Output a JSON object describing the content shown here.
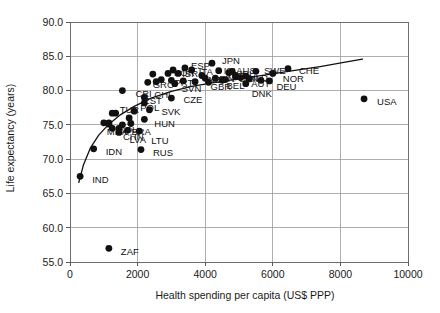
{
  "chart_data": {
    "type": "scatter",
    "title": "",
    "xlabel": "Health spending per capita (US$ PPP)",
    "ylabel": "Life expectancy (years)",
    "xlim": [
      0,
      10000
    ],
    "ylim": [
      55.0,
      90.0
    ],
    "xticks": [
      0,
      2000,
      4000,
      6000,
      8000,
      10000
    ],
    "xtick_labels": [
      "0",
      "2000",
      "4000",
      "6000",
      "8000",
      "10000"
    ],
    "yticks": [
      55.0,
      60.0,
      65.0,
      70.0,
      75.0,
      80.0,
      85.0,
      90.0
    ],
    "ytick_labels": [
      "55.0",
      "60.0",
      "65.0",
      "70.0",
      "75.0",
      "80.0",
      "85.0",
      "90.0"
    ],
    "grid": true,
    "legend": "none",
    "marker_color": "#111111",
    "trend_color": "#111111",
    "points": [
      {
        "label": "IND",
        "x": 300,
        "y": 67.5,
        "lx": 12,
        "ly": 3.5
      },
      {
        "label": "ZAF",
        "x": 1150,
        "y": 57.0,
        "lx": 12,
        "ly": 3.5
      },
      {
        "label": "IDN",
        "x": 700,
        "y": 71.5,
        "lx": 12,
        "ly": 3.5
      },
      {
        "label": "RUS",
        "x": 2100,
        "y": 71.4,
        "lx": 12,
        "ly": 3.5
      },
      {
        "label": "COL",
        "x": 1150,
        "y": 75.3,
        "lx": 9,
        "ly": 7.5
      },
      {
        "label": "CHN",
        "x": 1450,
        "y": 74.5,
        "lx": 4,
        "ly": 9
      },
      {
        "label": "TUR",
        "x": 1350,
        "y": 76.7,
        "lx": 4,
        "ly": -3
      },
      {
        "label": "POL",
        "x": 1900,
        "y": 77.0,
        "lx": 6,
        "ly": -3
      },
      {
        "label": "LVA",
        "x": 1700,
        "y": 74.2,
        "lx": 2,
        "ly": 10
      },
      {
        "label": "LTU",
        "x": 2050,
        "y": 74.1,
        "lx": 12,
        "ly": 9.5
      },
      {
        "label": "BRA",
        "x": 1550,
        "y": 75.0,
        "lx": 9,
        "ly": 7
      },
      {
        "label": "MEX",
        "x": 1150,
        "y": 75.1,
        "lx": -2,
        "ly": 8
      },
      {
        "label": "HUN",
        "x": 2200,
        "y": 75.8,
        "lx": 10,
        "ly": 5
      },
      {
        "label": "SVK",
        "x": 2350,
        "y": 77.2,
        "lx": 12,
        "ly": 2
      },
      {
        "label": "CZE",
        "x": 3000,
        "y": 78.9,
        "lx": 12,
        "ly": 1.5
      },
      {
        "label": "CHL",
        "x": 2200,
        "y": 79.0,
        "lx": 10,
        "ly": -2
      },
      {
        "label": "CRI",
        "x": 1550,
        "y": 80.0,
        "lx": 13,
        "ly": 3
      },
      {
        "label": "EST",
        "x": 2200,
        "y": 78.2,
        "lx": -1,
        "ly": -2
      },
      {
        "label": "GRC",
        "x": 2300,
        "y": 81.2,
        "lx": 5,
        "ly": 3
      },
      {
        "label": "KOR",
        "x": 2900,
        "y": 82.5,
        "lx": 6,
        "ly": 0
      },
      {
        "label": "SVN",
        "x": 3100,
        "y": 81.0,
        "lx": 7,
        "ly": 5
      },
      {
        "label": "PRT",
        "x": 3000,
        "y": 81.5,
        "lx": 3,
        "ly": 3
      },
      {
        "label": "ESP",
        "x": 3400,
        "y": 83.3,
        "lx": 6,
        "ly": -2
      },
      {
        "label": "ITA",
        "x": 3600,
        "y": 83.0,
        "lx": 7,
        "ly": 2
      },
      {
        "label": "JPN",
        "x": 4200,
        "y": 84.0,
        "lx": 10,
        "ly": -2
      },
      {
        "label": "ISR",
        "x": 3200,
        "y": 82.5,
        "lx": 4,
        "ly": 1
      },
      {
        "label": "NZL",
        "x": 4000,
        "y": 81.8,
        "lx": 3,
        "ly": 2
      },
      {
        "label": "FIN",
        "x": 4300,
        "y": 81.8,
        "lx": 4,
        "ly": 1
      },
      {
        "label": "GBR",
        "x": 4100,
        "y": 81.2,
        "lx": 2,
        "ly": 5
      },
      {
        "label": "ISL",
        "x": 4400,
        "y": 82.9,
        "lx": 5,
        "ly": 0
      },
      {
        "label": "AUS",
        "x": 4800,
        "y": 82.8,
        "lx": 4,
        "ly": 0
      },
      {
        "label": "FRA",
        "x": 4700,
        "y": 82.6,
        "lx": 3,
        "ly": 3
      },
      {
        "label": "CAN",
        "x": 4900,
        "y": 82.0,
        "lx": 3,
        "ly": 2
      },
      {
        "label": "BEL",
        "x": 4600,
        "y": 81.6,
        "lx": 1,
        "ly": 6
      },
      {
        "label": "IRL",
        "x": 4900,
        "y": 82.2,
        "lx": 4,
        "ly": -1
      },
      {
        "label": "NLD",
        "x": 5200,
        "y": 82.1,
        "lx": 3,
        "ly": 2
      },
      {
        "label": "AUT",
        "x": 5300,
        "y": 81.7,
        "lx": 2,
        "ly": 5
      },
      {
        "label": "SWE",
        "x": 5500,
        "y": 82.8,
        "lx": 8,
        "ly": 0
      },
      {
        "label": "DEU",
        "x": 5900,
        "y": 81.4,
        "lx": 7,
        "ly": 6
      },
      {
        "label": "DNK",
        "x": 5200,
        "y": 81.0,
        "lx": 6,
        "ly": 10
      },
      {
        "label": "NOR",
        "x": 6000,
        "y": 82.5,
        "lx": 10,
        "ly": 6
      },
      {
        "label": "CHE",
        "x": 6450,
        "y": 83.2,
        "lx": 11,
        "ly": 2
      },
      {
        "label": "USA",
        "x": 8700,
        "y": 78.8,
        "lx": 13,
        "ly": 3.5
      },
      {
        "label": "",
        "x": 1000,
        "y": 75.3,
        "lx": 0,
        "ly": 0
      },
      {
        "label": "",
        "x": 1250,
        "y": 76.7,
        "lx": 0,
        "ly": 0
      },
      {
        "label": "",
        "x": 1750,
        "y": 76.0,
        "lx": 0,
        "ly": 0
      },
      {
        "label": "",
        "x": 1450,
        "y": 73.9,
        "lx": 0,
        "ly": 0
      },
      {
        "label": "",
        "x": 1800,
        "y": 75.2,
        "lx": 0,
        "ly": 0
      },
      {
        "label": "",
        "x": 1250,
        "y": 74.5,
        "lx": 0,
        "ly": 0
      },
      {
        "label": "",
        "x": 2550,
        "y": 81.3,
        "lx": 0,
        "ly": 0
      },
      {
        "label": "",
        "x": 2700,
        "y": 81.6,
        "lx": 0,
        "ly": 0
      },
      {
        "label": "",
        "x": 3350,
        "y": 81.4,
        "lx": 0,
        "ly": 0
      },
      {
        "label": "",
        "x": 3700,
        "y": 81.3,
        "lx": 0,
        "ly": 0
      },
      {
        "label": "",
        "x": 3900,
        "y": 82.2,
        "lx": 0,
        "ly": 0
      },
      {
        "label": "",
        "x": 4500,
        "y": 81.5,
        "lx": 0,
        "ly": 0
      },
      {
        "label": "",
        "x": 5050,
        "y": 81.9,
        "lx": 0,
        "ly": 0
      },
      {
        "label": "",
        "x": 5650,
        "y": 81.5,
        "lx": 0,
        "ly": 0
      },
      {
        "label": "",
        "x": 2450,
        "y": 82.4,
        "lx": 0,
        "ly": 0
      },
      {
        "label": "",
        "x": 3050,
        "y": 83.0,
        "lx": 0,
        "ly": 0
      }
    ],
    "trend_line": [
      {
        "x": 260,
        "y": 66.6
      },
      {
        "x": 400,
        "y": 69.2
      },
      {
        "x": 600,
        "y": 71.6
      },
      {
        "x": 850,
        "y": 73.5
      },
      {
        "x": 1150,
        "y": 75.1
      },
      {
        "x": 1500,
        "y": 76.5
      },
      {
        "x": 1900,
        "y": 77.7
      },
      {
        "x": 2400,
        "y": 78.9
      },
      {
        "x": 3000,
        "y": 79.9
      },
      {
        "x": 3600,
        "y": 80.6
      },
      {
        "x": 4300,
        "y": 81.2
      },
      {
        "x": 5000,
        "y": 81.7
      },
      {
        "x": 5800,
        "y": 82.3
      },
      {
        "x": 6600,
        "y": 82.9
      },
      {
        "x": 7400,
        "y": 83.5
      },
      {
        "x": 8100,
        "y": 84.1
      },
      {
        "x": 8650,
        "y": 84.6
      }
    ]
  }
}
